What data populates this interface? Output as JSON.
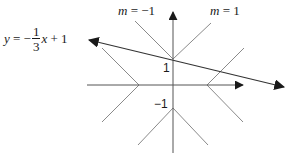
{
  "diagram": {
    "labels": {
      "slope_neg": {
        "var": "m",
        "eq": " = ",
        "value": "−1"
      },
      "slope_pos": {
        "var": "m",
        "eq": " = ",
        "value": "1"
      },
      "equation": {
        "lhs": "y",
        "eq": " = −",
        "frac_num": "1",
        "frac_den": "3",
        "var": "x",
        "rest": " + 1"
      },
      "tick_pos1": "1",
      "tick_neg1": "−1"
    },
    "colors": {
      "axis": "#333333",
      "line": "#333333",
      "guide": "#8a8a8a",
      "text": "#1a1a1a"
    }
  }
}
